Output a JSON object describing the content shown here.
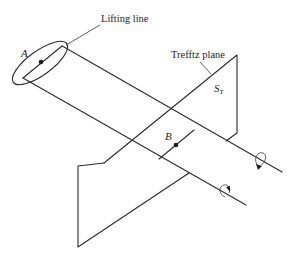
{
  "figure": {
    "type": "line-drawing",
    "labels": {
      "lifting_line": "Lifting line",
      "trefftz_plane": "Trefftz plane",
      "point_a": "A",
      "point_b": "B",
      "surface": "S",
      "surface_subscript": "T"
    },
    "elements": [
      {
        "name": "wing-ellipse",
        "description": "Elliptical wing planform outline around the lifting line"
      },
      {
        "name": "lifting-line",
        "description": "Bound vortex segment across the wing"
      },
      {
        "name": "trailing-vortex-upper",
        "description": "Trailing vortex from wing tip, with rotation arrow"
      },
      {
        "name": "trailing-vortex-lower",
        "description": "Trailing vortex from opposite wing tip, with rotation arrow"
      },
      {
        "name": "trefftz-plane",
        "description": "Downstream plane S_T perpendicular to the wake"
      },
      {
        "name": "wake-cross-line",
        "description": "Intersection of the wake sheet with the Trefftz plane, containing point B"
      }
    ],
    "colors": {
      "ink": "#2b2b2b",
      "background": "#ffffff"
    }
  }
}
